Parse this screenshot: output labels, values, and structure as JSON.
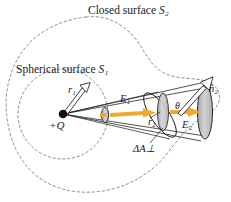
{
  "figure": {
    "type": "physics-diagram"
  },
  "labels": {
    "closed_surface": "Closed surface",
    "closed_surface_sub": "S₂",
    "spherical_surface": "Spherical surface",
    "spherical_surface_sub": "S₁",
    "radius_inner": "r₁",
    "radius_outer": "r₂",
    "charge": "+Q",
    "field_inner": "E₁",
    "field_outer": "E₂",
    "angle": "θ",
    "normal_vector": "n̂₂",
    "area_perp": "ΔA⊥"
  },
  "colors": {
    "field_arrow": "#f0a830",
    "field_arrow_dark": "#d98e16",
    "outline": "#1a1a1a",
    "dashed_surface": "#8a8a8a",
    "disk_fill": "#b8b8b8",
    "disk_fill_light": "#cfcfcf",
    "background": "#ffffff"
  },
  "geometry": {
    "charge_point": [
      63,
      114
    ],
    "sphere_center": [
      63,
      114
    ],
    "sphere_radius": 45,
    "cone_apex": [
      63,
      114
    ],
    "disk_inner": [
      105,
      115
    ],
    "disk_mid": [
      163,
      112
    ],
    "disk_outer": [
      205,
      112
    ],
    "normal_arrow_tip": [
      214,
      74
    ]
  }
}
